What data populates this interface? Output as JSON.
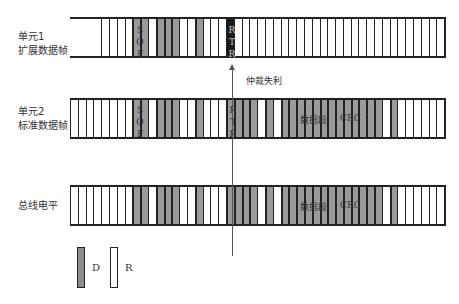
{
  "top_clipped_text": "...",
  "rows": [
    {
      "id": "unit1",
      "label_line1": "单元1",
      "label_line2": "扩展数据帧",
      "bits": "XXXXRRRRDDRDDDRRDRRRBRRRRRRRRRRRRRRRRRRRRRRRRRRR",
      "sof_label": "S O F",
      "rtr_label": "R T R"
    },
    {
      "id": "unit2",
      "label_line1": "单元2",
      "label_line2": "标准数据帧",
      "bits": "RRRRRRRRDDRDDDRRDRRRDDDDRDRDDDDDDDDDDDDDRDRRRRRRRRR",
      "sof_label": "S O F",
      "rtr_label": "R T R",
      "data_label": "数据段",
      "crc_label": "CRC"
    },
    {
      "id": "bus",
      "label_line1": "总线电平",
      "label_line2": "",
      "bits": "RRRRRRRRDDRDDDRRDRRRDDDDRDRDDDDDDDDDDDDDRDRRRRRRRRR",
      "data_label": "数据段",
      "crc_label": "CRC"
    }
  ],
  "annotation": {
    "arbitration_lost": "仲裁失利"
  },
  "legend": [
    {
      "key": "D",
      "label": "D",
      "meaning": "dominant",
      "color": "#8c8c8c"
    },
    {
      "key": "R",
      "label": "R",
      "meaning": "recessive",
      "color": "#ffffff"
    }
  ]
}
